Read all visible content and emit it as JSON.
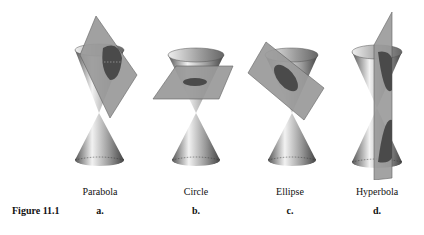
{
  "figure": {
    "caption": "Figure 11.1",
    "panels": [
      {
        "letter": "a.",
        "name": "Parabola",
        "x": 100
      },
      {
        "letter": "b.",
        "name": "Circle",
        "x": 196
      },
      {
        "letter": "c.",
        "name": "Ellipse",
        "x": 290
      },
      {
        "letter": "d.",
        "name": "Hyperbola",
        "x": 377
      }
    ]
  }
}
